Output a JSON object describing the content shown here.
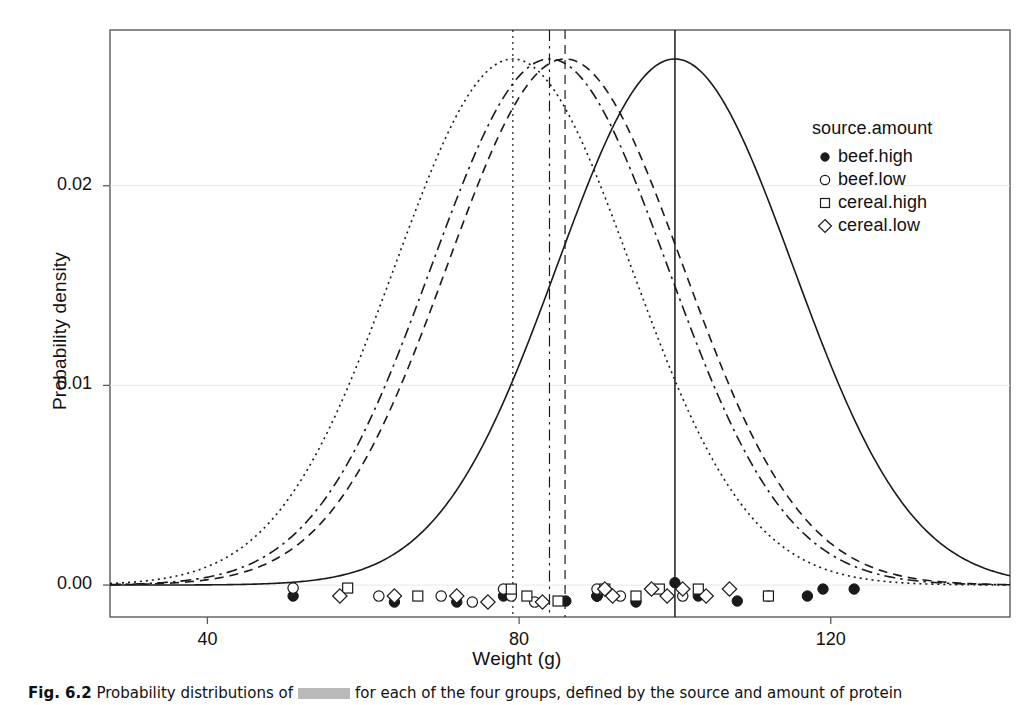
{
  "figure": {
    "caption_prefix": "Fig. 6.2",
    "caption_text": "Probability distributions of",
    "caption_redacted": "████████",
    "caption_rest": "for each of the four groups, defined by the source and amount of protein"
  },
  "axes": {
    "x": {
      "label": "Weight (g)",
      "ticks": [
        40,
        80,
        120
      ],
      "tick_labels": [
        "40",
        "80",
        "120"
      ],
      "min": 27.5,
      "max": 143.0
    },
    "y": {
      "label": "Probability density",
      "ticks": [
        0.0,
        0.01,
        0.02
      ],
      "tick_labels": [
        "0.00",
        "0.01",
        "0.02"
      ],
      "min": -0.0016,
      "max": 0.0278
    }
  },
  "legend": {
    "title": "source.amount",
    "items": [
      {
        "label": "beef.high",
        "marker": "filled-circle"
      },
      {
        "label": "beef.low",
        "marker": "open-circle"
      },
      {
        "label": "cereal.high",
        "marker": "open-square"
      },
      {
        "label": "cereal.low",
        "marker": "open-diamond"
      }
    ]
  },
  "chart_data": {
    "type": "line",
    "title": "",
    "xlabel": "Weight (g)",
    "ylabel": "Probability density",
    "xlim": [
      27.5,
      143.0
    ],
    "ylim": [
      -0.0016,
      0.0278
    ],
    "grid": false,
    "legend_position": "upper-right",
    "series": [
      {
        "name": "beef.high",
        "marker": "filled-circle",
        "linestyle": "solid",
        "mean": 100.0,
        "sd": 15.14,
        "peak_density": 0.02635,
        "reference_line_x": 100.0
      },
      {
        "name": "beef.low",
        "marker": "open-circle",
        "linestyle": "dashed",
        "mean": 85.9,
        "sd": 15.14,
        "peak_density": 0.02635,
        "reference_line_x": 85.9
      },
      {
        "name": "cereal.high",
        "marker": "open-square",
        "linestyle": "dashdot",
        "mean": 83.9,
        "sd": 15.14,
        "peak_density": 0.02635,
        "reference_line_x": 83.9
      },
      {
        "name": "cereal.low",
        "marker": "open-diamond",
        "linestyle": "dotted",
        "mean": 79.2,
        "sd": 15.14,
        "peak_density": 0.02635,
        "reference_line_x": 79.2
      }
    ],
    "observations": [
      {
        "group": "beef.high",
        "x": 90.0,
        "jitter": -0.00055
      },
      {
        "group": "beef.high",
        "x": 76.0,
        "jitter": -0.00085
      },
      {
        "group": "beef.high",
        "x": 90.0,
        "jitter": -0.00055
      },
      {
        "group": "beef.high",
        "x": 64.0,
        "jitter": -0.00085
      },
      {
        "group": "beef.high",
        "x": 86.0,
        "jitter": -0.0008
      },
      {
        "group": "beef.high",
        "x": 51.0,
        "jitter": -0.00055
      },
      {
        "group": "beef.high",
        "x": 72.0,
        "jitter": -0.00085
      },
      {
        "group": "beef.high",
        "x": 90.0,
        "jitter": -0.00055
      },
      {
        "group": "beef.high",
        "x": 95.0,
        "jitter": -0.00085
      },
      {
        "group": "beef.high",
        "x": 78.0,
        "jitter": -0.00055
      },
      {
        "group": "beef.high",
        "x": 100.0,
        "jitter": 0.00012
      },
      {
        "group": "beef.high",
        "x": 103.0,
        "jitter": -0.00055
      },
      {
        "group": "beef.high",
        "x": 108.0,
        "jitter": -0.0008
      },
      {
        "group": "beef.high",
        "x": 112.0,
        "jitter": -0.00055
      },
      {
        "group": "beef.high",
        "x": 119.0,
        "jitter": -0.0002
      },
      {
        "group": "beef.high",
        "x": 117.0,
        "jitter": -0.00055
      },
      {
        "group": "beef.high",
        "x": 123.0,
        "jitter": -0.0002
      },
      {
        "group": "beef.low",
        "x": 51.0,
        "jitter": -0.00015
      },
      {
        "group": "beef.low",
        "x": 62.0,
        "jitter": -0.00055
      },
      {
        "group": "beef.low",
        "x": 70.0,
        "jitter": -0.00055
      },
      {
        "group": "beef.low",
        "x": 74.0,
        "jitter": -0.00085
      },
      {
        "group": "beef.low",
        "x": 78.0,
        "jitter": -0.0002
      },
      {
        "group": "beef.low",
        "x": 79.0,
        "jitter": -0.00055
      },
      {
        "group": "beef.low",
        "x": 82.0,
        "jitter": -0.00085
      },
      {
        "group": "beef.low",
        "x": 90.0,
        "jitter": -0.0002
      },
      {
        "group": "beef.low",
        "x": 93.0,
        "jitter": -0.00055
      },
      {
        "group": "beef.low",
        "x": 97.0,
        "jitter": -0.0002
      },
      {
        "group": "beef.low",
        "x": 101.0,
        "jitter": -0.00055
      },
      {
        "group": "cereal.high",
        "x": 58.0,
        "jitter": -0.00015
      },
      {
        "group": "cereal.high",
        "x": 67.0,
        "jitter": -0.00055
      },
      {
        "group": "cereal.high",
        "x": 79.0,
        "jitter": -0.0002
      },
      {
        "group": "cereal.high",
        "x": 81.0,
        "jitter": -0.00055
      },
      {
        "group": "cereal.high",
        "x": 85.0,
        "jitter": -0.0008
      },
      {
        "group": "cereal.high",
        "x": 91.0,
        "jitter": -0.0002
      },
      {
        "group": "cereal.high",
        "x": 95.0,
        "jitter": -0.00055
      },
      {
        "group": "cereal.high",
        "x": 98.0,
        "jitter": -0.0002
      },
      {
        "group": "cereal.high",
        "x": 103.0,
        "jitter": -0.0002
      },
      {
        "group": "cereal.high",
        "x": 112.0,
        "jitter": -0.00055
      },
      {
        "group": "cereal.low",
        "x": 57.0,
        "jitter": -0.00055
      },
      {
        "group": "cereal.low",
        "x": 64.0,
        "jitter": -0.00055
      },
      {
        "group": "cereal.low",
        "x": 72.0,
        "jitter": -0.00055
      },
      {
        "group": "cereal.low",
        "x": 76.0,
        "jitter": -0.00085
      },
      {
        "group": "cereal.low",
        "x": 83.0,
        "jitter": -0.00085
      },
      {
        "group": "cereal.low",
        "x": 91.0,
        "jitter": -0.0002
      },
      {
        "group": "cereal.low",
        "x": 92.0,
        "jitter": -0.00055
      },
      {
        "group": "cereal.low",
        "x": 97.0,
        "jitter": -0.0002
      },
      {
        "group": "cereal.low",
        "x": 99.0,
        "jitter": -0.00055
      },
      {
        "group": "cereal.low",
        "x": 101.0,
        "jitter": -0.0002
      },
      {
        "group": "cereal.low",
        "x": 104.0,
        "jitter": -0.00055
      },
      {
        "group": "cereal.low",
        "x": 107.0,
        "jitter": -0.0002
      }
    ]
  },
  "style": {
    "line_color": "#1a1a1a",
    "frame_color": "#5a5a5a",
    "background": "#ffffff"
  }
}
